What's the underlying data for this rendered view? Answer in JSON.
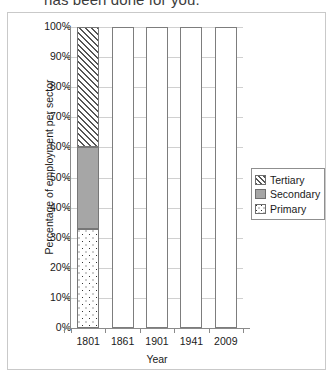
{
  "instruction": "has been done for you.",
  "chart_data": {
    "type": "bar",
    "subtype": "stacked-100-percent",
    "title": "",
    "xlabel": "Year",
    "ylabel": "Percentage of employment per sector",
    "categories": [
      "1801",
      "1861",
      "1901",
      "1941",
      "2009"
    ],
    "ylim": [
      0,
      100
    ],
    "ytick_labels": [
      "0%",
      "10%",
      "20%",
      "30%",
      "40%",
      "50%",
      "60%",
      "70%",
      "80%",
      "90%",
      "100%"
    ],
    "ytick_values": [
      0,
      10,
      20,
      30,
      40,
      50,
      60,
      70,
      80,
      90,
      100
    ],
    "grid": true,
    "legend_position": "right",
    "series": [
      {
        "name": "Tertiary",
        "pattern": "diagonal-hatch",
        "color": "#ffffff",
        "values": [
          40,
          null,
          null,
          null,
          null
        ]
      },
      {
        "name": "Secondary",
        "pattern": "solid",
        "color": "#a6a6a6",
        "values": [
          27,
          null,
          null,
          null,
          null
        ]
      },
      {
        "name": "Primary",
        "pattern": "dotted",
        "color": "#ffffff",
        "values": [
          33,
          null,
          null,
          null,
          null
        ]
      }
    ],
    "bars": [
      {
        "category": "1801",
        "filled": true,
        "segments": [
          {
            "name": "Primary",
            "from": 0,
            "to": 33
          },
          {
            "name": "Secondary",
            "from": 33,
            "to": 60
          },
          {
            "name": "Tertiary",
            "from": 60,
            "to": 100
          }
        ]
      },
      {
        "category": "1861",
        "filled": false,
        "segments": [
          {
            "name": "Empty",
            "from": 0,
            "to": 100
          }
        ]
      },
      {
        "category": "1901",
        "filled": false,
        "segments": [
          {
            "name": "Empty",
            "from": 0,
            "to": 100
          }
        ]
      },
      {
        "category": "1941",
        "filled": false,
        "segments": [
          {
            "name": "Empty",
            "from": 0,
            "to": 100
          }
        ]
      },
      {
        "category": "2009",
        "filled": false,
        "segments": [
          {
            "name": "Empty",
            "from": 0,
            "to": 100
          }
        ]
      }
    ],
    "annotations": []
  },
  "legend": {
    "items": [
      {
        "label": "Tertiary"
      },
      {
        "label": "Secondary"
      },
      {
        "label": "Primary"
      }
    ]
  }
}
